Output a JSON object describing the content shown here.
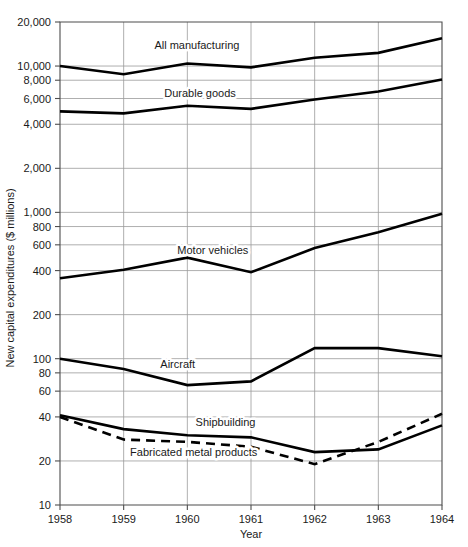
{
  "chart_data": {
    "type": "line",
    "title": "",
    "xlabel": "Year",
    "ylabel": "New capital expenditures ($ millions)",
    "x": [
      1958,
      1959,
      1960,
      1961,
      1962,
      1963,
      1964
    ],
    "xtick_labels": [
      "1958",
      "1959",
      "1960",
      "1961",
      "1962",
      "1963",
      "1964"
    ],
    "yscale": "log",
    "ylim": [
      10,
      20000
    ],
    "ytick_values": [
      20000,
      10000,
      8000,
      6000,
      4000,
      2000,
      1000,
      800,
      600,
      400,
      200,
      100,
      80,
      60,
      40,
      20,
      10
    ],
    "ytick_labels": [
      "20,000",
      "10,000",
      "8,000",
      "6,000",
      "4,000",
      "2,000",
      "1,000",
      "800",
      "600",
      "400",
      "200",
      "100",
      "80",
      "60",
      "40",
      "20",
      "10"
    ],
    "grid": true,
    "legend_position": "inline-labels",
    "series": [
      {
        "name": "All manufacturing",
        "style": "solid",
        "label_x": 1960.15,
        "label_y": 13100,
        "values": [
          10000,
          8800,
          10400,
          9800,
          11400,
          12300,
          15500
        ]
      },
      {
        "name": "Durable goods",
        "style": "solid",
        "label_x": 1960.2,
        "label_y": 6150,
        "values": [
          4900,
          4750,
          5350,
          5100,
          5900,
          6700,
          8100
        ]
      },
      {
        "name": "Motor vehicles",
        "style": "solid",
        "label_x": 1960.4,
        "label_y": 520,
        "values": [
          355,
          405,
          490,
          390,
          570,
          730,
          980
        ]
      },
      {
        "name": "Aircraft",
        "style": "solid",
        "label_x": 1959.85,
        "label_y": 86,
        "values": [
          100,
          85,
          66,
          70,
          118,
          118,
          104
        ]
      },
      {
        "name": "Shipbuilding",
        "style": "solid",
        "label_x": 1960.6,
        "label_y": 34.5,
        "values": [
          41,
          33,
          30,
          29,
          23,
          24,
          35
        ]
      },
      {
        "name": "Fabricated metal products",
        "style": "dashed",
        "label_x": 1960.1,
        "label_y": 21.5,
        "values": [
          40,
          28,
          27,
          25,
          19,
          27,
          42
        ]
      }
    ]
  }
}
